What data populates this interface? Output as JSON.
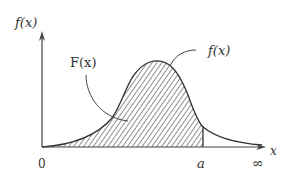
{
  "diagram": {
    "type": "probability-density-curve",
    "y_axis_label": "f(x)",
    "x_axis_label": "x",
    "origin_label": "0",
    "marker_label": "a",
    "infinity_label": "∞",
    "cdf_label": "F(x)",
    "curve_label": "f(x)",
    "colors": {
      "ink": "#333333",
      "hatch": "#444444",
      "background": "#ffffff"
    }
  }
}
